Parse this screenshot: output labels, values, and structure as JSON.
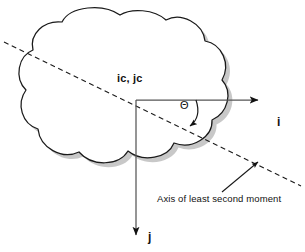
{
  "figure": {
    "kind": "geometry-diagram",
    "background_color": "#ffffff",
    "stroke_color": "#1a1a1a",
    "shadow_color": "#8a8a8a",
    "shape_fill": "#ffffff",
    "shape_name": "cloud-blob-region"
  },
  "labels": {
    "centroid": "ic, jc",
    "axis_i": "i",
    "axis_j": "j",
    "angle": "Θ",
    "axis_caption": "Axis of least second moment"
  },
  "icons": {
    "arrow_i": "arrow-right-icon",
    "arrow_j": "arrow-down-icon",
    "arrow_angle": "curved-arrow-icon",
    "arrow_pointer": "leader-arrow-icon",
    "dashed_axis": "dashed-line-icon"
  },
  "geometry": {
    "origin": {
      "x": 136,
      "y": 100
    },
    "i_axis_end": {
      "x": 262,
      "y": 100
    },
    "j_axis_end": {
      "x": 136,
      "y": 240
    },
    "dashed_axis_start": {
      "x": 4,
      "y": 42
    },
    "dashed_axis_end": {
      "x": 301,
      "y": 186
    },
    "angle_degrees": 26
  }
}
